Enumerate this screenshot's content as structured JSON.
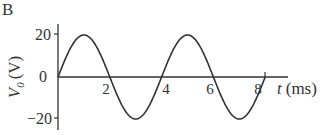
{
  "panel_label": "B",
  "chart_data": {
    "type": "line",
    "title": "",
    "xlabel": "t (ms)",
    "ylabel": "V0 (V)",
    "ylabel_main": "V",
    "ylabel_sub": "0",
    "ylabel_unit": "(V)",
    "xlabel_var": "t",
    "xlabel_unit": "(ms)",
    "x_ticks": [
      2,
      4,
      6,
      8
    ],
    "y_ticks": [
      20,
      0,
      -20
    ],
    "y_tick_labels": [
      "20",
      "0",
      "−20"
    ],
    "xlim": [
      0,
      8.5
    ],
    "ylim": [
      -25,
      25
    ],
    "grid": false,
    "series": [
      {
        "name": "V0",
        "function": "20*sin(2*pi*t/4)",
        "amplitude": 20,
        "period_ms": 4,
        "x": [
          0,
          1,
          2,
          3,
          4,
          5,
          6,
          7,
          8
        ],
        "values": [
          0,
          20,
          0,
          -20,
          0,
          20,
          0,
          -20,
          0
        ]
      }
    ]
  }
}
